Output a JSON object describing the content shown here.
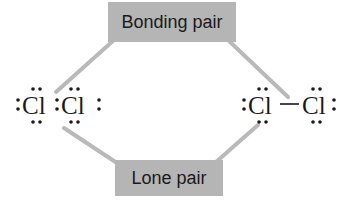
{
  "labels": {
    "bonding_pair": "Bonding pair",
    "lone_pair": "Lone pair"
  },
  "molecules": {
    "left": {
      "notation": "Lewis dot (electron dots)",
      "atoms": [
        "Cl",
        "Cl"
      ]
    },
    "right": {
      "notation": "Lewis line (bond dash)",
      "atoms": [
        "Cl",
        "Cl"
      ]
    }
  },
  "colors": {
    "label_box": "#b5b5b5",
    "connector": "#b9b9b9",
    "text": "#1a1a1a"
  }
}
